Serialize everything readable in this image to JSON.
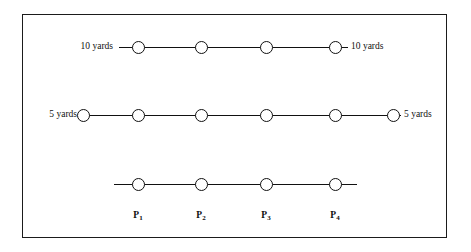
{
  "diagram": {
    "background_color": "#ffffff",
    "stroke_color": "#111111",
    "border_color": "#1b1b1b",
    "rows": [
      {
        "id": "row-10-yards",
        "left_label": "10 yards",
        "right_label": "10 yards",
        "node_count": 4,
        "y": 46,
        "line_start_x": 118,
        "line_end_x": 347,
        "node_x": [
          137,
          200,
          265,
          334
        ]
      },
      {
        "id": "row-5-yards",
        "left_label": "5 yards",
        "right_label": "5 yards",
        "node_count": 6,
        "y": 114,
        "line_start_x": 82,
        "line_end_x": 400,
        "node_x": [
          82,
          137,
          200,
          265,
          334,
          392
        ]
      },
      {
        "id": "row-unlabeled",
        "left_label": "",
        "right_label": "",
        "node_count": 4,
        "y": 183,
        "line_start_x": 113,
        "line_end_x": 356,
        "node_x": [
          137,
          200,
          265,
          334
        ]
      }
    ],
    "point_labels": [
      {
        "base": "P",
        "sub": "1",
        "x": 137,
        "y": 210
      },
      {
        "base": "P",
        "sub": "2",
        "x": 200,
        "y": 210
      },
      {
        "base": "P",
        "sub": "3",
        "x": 265,
        "y": 210
      },
      {
        "base": "P",
        "sub": "4",
        "x": 334,
        "y": 210
      }
    ]
  }
}
